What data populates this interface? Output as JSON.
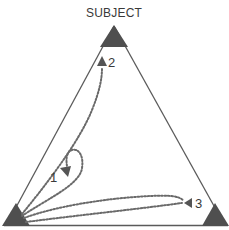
{
  "diagram": {
    "title": "SUBJECT",
    "colors": {
      "edge": "#5a5a5a",
      "vertex": "#4f4f4f",
      "path": "#6a6a6a",
      "text": "#3a3a3a"
    },
    "vertices": [
      {
        "id": "top",
        "label": "SUBJECT"
      },
      {
        "id": "bottom-left",
        "label": ""
      },
      {
        "id": "bottom-right",
        "label": ""
      }
    ],
    "paths": [
      {
        "id": "path-1",
        "label": "1",
        "from": "bottom-left",
        "shape": "loop"
      },
      {
        "id": "path-2",
        "label": "2",
        "from": "bottom-left",
        "to": "top"
      },
      {
        "id": "path-3",
        "label": "3",
        "from": "bottom-left",
        "to": "bottom-right"
      }
    ]
  }
}
